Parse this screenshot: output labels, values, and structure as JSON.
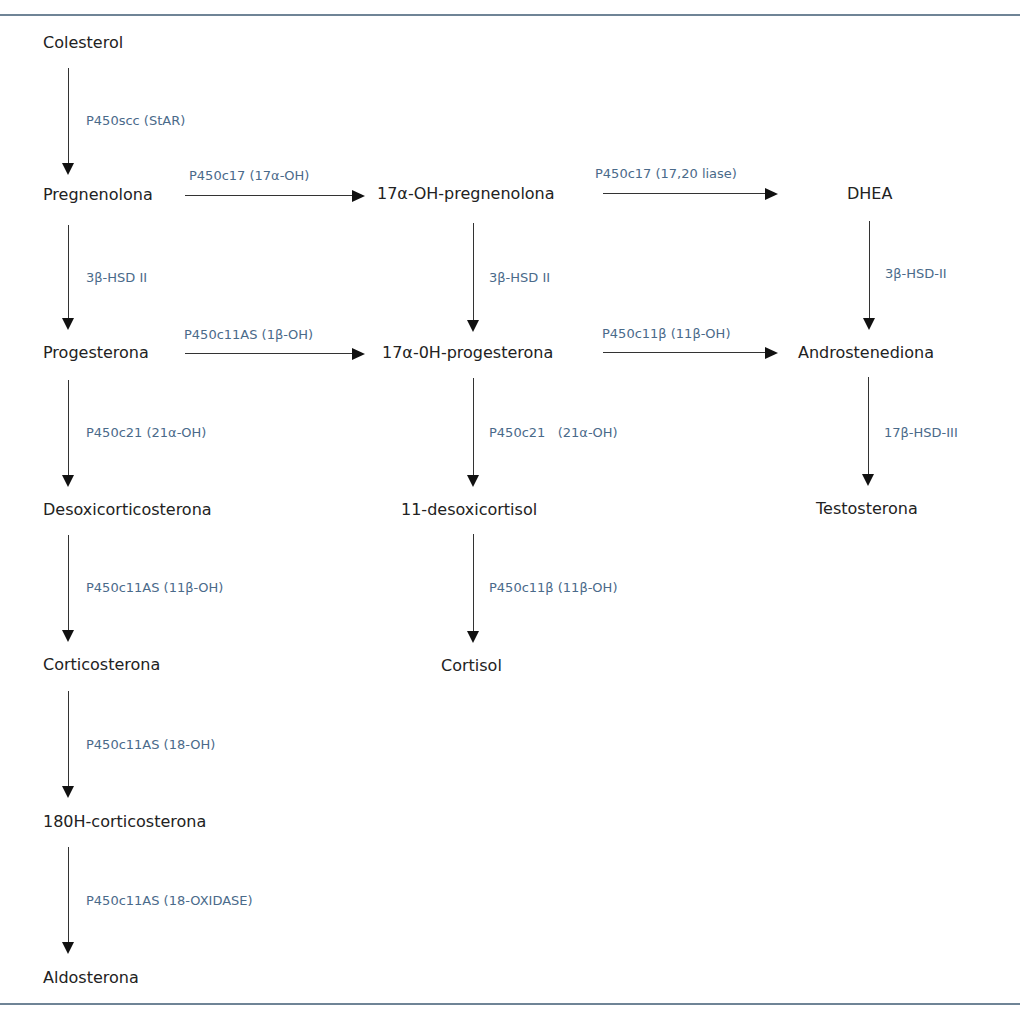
{
  "diagram": {
    "type": "steroidogenesis-pathway",
    "colors": {
      "substrate_text": "#222222",
      "enzyme_text": "#4a6a8a",
      "rule": "#6f8496",
      "arrow": "#111111"
    },
    "nodes": {
      "colesterol": "Colesterol",
      "pregnenolona": "Pregnenolona",
      "oh_pregnenolona": "17α-OH-pregnenolona",
      "dhea": "DHEA",
      "progesterona": "Progesterona",
      "oh_progesterona": "17α-0H-progesterona",
      "androstenediona": "Androstenediona",
      "desoxicorticosterona": "Desoxicorticosterona",
      "desoxicortisol": "11-desoxicortisol",
      "testosterona": "Testosterona",
      "corticosterona": "Corticosterona",
      "cortisol": "Cortisol",
      "oh_corticosterona": "180H-corticosterona",
      "aldosterona": "Aldosterona"
    },
    "enzymes": {
      "e1": "P450scc (StAR)",
      "e2": "P450c17 (17α-OH)",
      "e3": "P450c17 (17,20 liase)",
      "e4": "3β-HSD II",
      "e5": "3β-HSD II",
      "e6": "3β-HSD-II",
      "e7": "P450c11AS (1β-OH)",
      "e8": "P450c11β (11β-OH)",
      "e9": "P450c21 (21α-OH)",
      "e10": "P450c21   (21α-OH)",
      "e11": "17β-HSD-III",
      "e12": "P450c11AS (11β-OH)",
      "e13": "P450c11β (11β-OH)",
      "e14": "P450c11AS (18-OH)",
      "e15": "P450c11AS (18-OXIDASE)"
    },
    "edges": [
      {
        "from": "Colesterol",
        "to": "Pregnenolona",
        "enzyme": "P450scc (StAR)"
      },
      {
        "from": "Pregnenolona",
        "to": "17α-OH-pregnenolona",
        "enzyme": "P450c17 (17α-OH)"
      },
      {
        "from": "17α-OH-pregnenolona",
        "to": "DHEA",
        "enzyme": "P450c17 (17,20 liase)"
      },
      {
        "from": "Pregnenolona",
        "to": "Progesterona",
        "enzyme": "3β-HSD II"
      },
      {
        "from": "17α-OH-pregnenolona",
        "to": "17α-0H-progesterona",
        "enzyme": "3β-HSD II"
      },
      {
        "from": "DHEA",
        "to": "Androstenediona",
        "enzyme": "3β-HSD-II"
      },
      {
        "from": "Progesterona",
        "to": "17α-0H-progesterona",
        "enzyme": "P450c11AS (1β-OH)"
      },
      {
        "from": "17α-0H-progesterona",
        "to": "Androstenediona",
        "enzyme": "P450c11β (11β-OH)"
      },
      {
        "from": "Progesterona",
        "to": "Desoxicorticosterona",
        "enzyme": "P450c21 (21α-OH)"
      },
      {
        "from": "17α-0H-progesterona",
        "to": "11-desoxicortisol",
        "enzyme": "P450c21 (21α-OH)"
      },
      {
        "from": "Androstenediona",
        "to": "Testosterona",
        "enzyme": "17β-HSD-III"
      },
      {
        "from": "Desoxicorticosterona",
        "to": "Corticosterona",
        "enzyme": "P450c11AS (11β-OH)"
      },
      {
        "from": "11-desoxicortisol",
        "to": "Cortisol",
        "enzyme": "P450c11β (11β-OH)"
      },
      {
        "from": "Corticosterona",
        "to": "180H-corticosterona",
        "enzyme": "P450c11AS (18-OH)"
      },
      {
        "from": "180H-corticosterona",
        "to": "Aldosterona",
        "enzyme": "P450c11AS (18-OXIDASE)"
      }
    ]
  }
}
